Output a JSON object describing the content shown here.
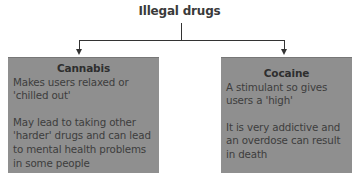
{
  "diagram": {
    "title": "Illegal drugs",
    "colors": {
      "box_fill": "#8f8f8f",
      "line": "#333333",
      "text": "#3a3a3a"
    },
    "boxes": [
      {
        "heading": "Cannabis",
        "paragraphs": [
          "Makes users relaxed or 'chilled out'",
          "May lead to taking other 'harder' drugs and can lead to mental health problems in some people"
        ]
      },
      {
        "heading": "Cocaine",
        "paragraphs": [
          "A stimulant so gives users a 'high'",
          "It is very addictive and an overdose can result in death"
        ]
      }
    ]
  }
}
